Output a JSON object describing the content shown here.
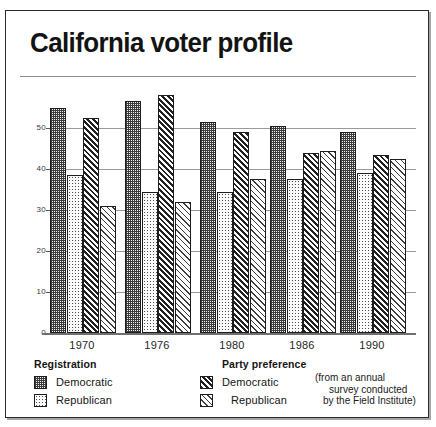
{
  "title": "California voter profile",
  "chart_data": {
    "type": "bar",
    "title": "California voter profile",
    "xlabel": "",
    "ylabel": "",
    "ylim": [
      0,
      58
    ],
    "yticks": [
      0,
      10,
      20,
      30,
      40,
      50
    ],
    "ytick_labels": [
      "0",
      "10",
      "20",
      "30",
      "40",
      "50"
    ],
    "grid": true,
    "legend_position": "bottom",
    "categories": [
      "1970",
      "1976",
      "1980",
      "1986",
      "1990"
    ],
    "series": [
      {
        "name": "Registration Democratic",
        "group": "Registration",
        "party": "Democratic",
        "pattern": "dark-checker",
        "values": [
          55.0,
          56.5,
          51.5,
          50.5,
          49.0
        ]
      },
      {
        "name": "Registration Republican",
        "group": "Registration",
        "party": "Republican",
        "pattern": "light-dot",
        "values": [
          38.5,
          34.5,
          34.5,
          37.5,
          39.0
        ]
      },
      {
        "name": "Party preference Democratic",
        "group": "Party preference",
        "party": "Democratic",
        "pattern": "dark-diagonal",
        "values": [
          52.5,
          58.0,
          49.0,
          44.0,
          43.5
        ]
      },
      {
        "name": "Party preference Republican",
        "group": "Party preference",
        "party": "Republican",
        "pattern": "light-diagonal",
        "values": [
          31.0,
          32.0,
          37.5,
          44.5,
          42.5
        ]
      }
    ],
    "annotation": "(from an annual survey conducted by the Field Institute)"
  },
  "legend": {
    "registration": {
      "heading": "Registration",
      "items": [
        {
          "label": "Democratic",
          "pattern": "dark-checker"
        },
        {
          "label": "Republican",
          "pattern": "light-dot"
        }
      ]
    },
    "party_preference": {
      "heading": "Party preference",
      "items": [
        {
          "label": "Democratic",
          "pattern": "dark-diagonal"
        },
        {
          "label": "Republican",
          "pattern": "light-diagonal"
        }
      ]
    },
    "note": {
      "line1": "(from an annual",
      "line2": "survey conducted",
      "line3": "by the Field Institute)"
    }
  }
}
